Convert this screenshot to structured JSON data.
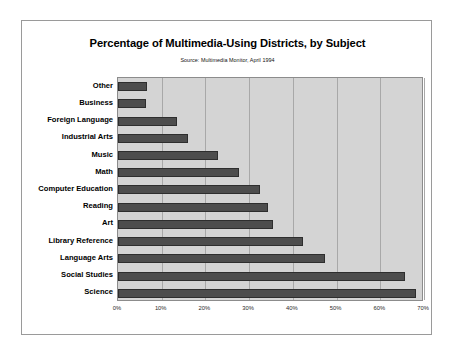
{
  "figure": {
    "title": "Percentage of Multimedia-Using Districts, by Subject",
    "subtitle": "Source: Multimedia Monitor, April 1994",
    "frame_color": "#9a9a9a",
    "background": "#ffffff"
  },
  "chart_data": {
    "type": "bar",
    "orientation": "horizontal",
    "title": "Percentage of Multimedia-Using Districts, by Subject",
    "subtitle": "Source: Multimedia Monitor, April 1994",
    "xlabel": "",
    "ylabel": "",
    "xlim": [
      0,
      70
    ],
    "grid": true,
    "legend": "none",
    "plot_background": "#d4d4d4",
    "bar_color": "#4d4d4d",
    "bar_edge_color": "#2e2e2e",
    "gridline_color": "#a8a8a8",
    "tick_labels": [
      "0%",
      "10%",
      "20%",
      "30%",
      "40%",
      "50%",
      "60%",
      "70%"
    ],
    "tick_values": [
      0,
      10,
      20,
      30,
      40,
      50,
      60,
      70
    ],
    "categories": [
      "Other",
      "Business",
      "Foreign Language",
      "Industrial Arts",
      "Music",
      "Math",
      "Computer Education",
      "Reading",
      "Art",
      "Library Reference",
      "Language Arts",
      "Social Studies",
      "Science"
    ],
    "values": [
      6.7,
      6.5,
      13.5,
      16,
      22.9,
      27.7,
      32.4,
      34.2,
      35.5,
      42.3,
      47.3,
      65.7,
      68.2
    ],
    "value_labels": [
      "7%",
      "7%",
      "14%",
      "16%",
      "23%",
      "28%",
      "32%",
      "34%",
      "36%",
      "42%",
      "47%",
      "66%",
      "68%"
    ]
  }
}
